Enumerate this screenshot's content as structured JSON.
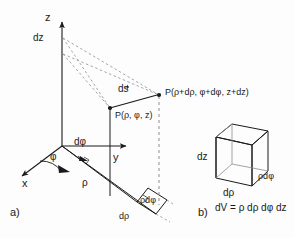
{
  "figure": {
    "background": "#fdfdfd",
    "line_color": "#1a1a1a",
    "dashed_color": "#9a9a9a",
    "width": 295,
    "height": 238
  },
  "panel_a": {
    "tag": "a)",
    "axes": {
      "z_label": "z",
      "y_label": "y",
      "x_label": "x"
    },
    "labels": {
      "dz": "dz",
      "phi": "φ",
      "dphi": "dφ",
      "rho": "ρ",
      "drho": "dρ",
      "rho_dphi": "ρdφ",
      "ds_d": "d",
      "ds_s": "s"
    },
    "points": {
      "inner": "P(ρ, φ, z)",
      "outer": "P(ρ+dρ, φ+dφ, z+dz)"
    }
  },
  "panel_b": {
    "tag": "b)",
    "cube_labels": {
      "dz": "dz",
      "drho": "dρ",
      "rho_dphi": "ρdφ"
    },
    "formula": "dV = ρ dρ dφ dz"
  }
}
